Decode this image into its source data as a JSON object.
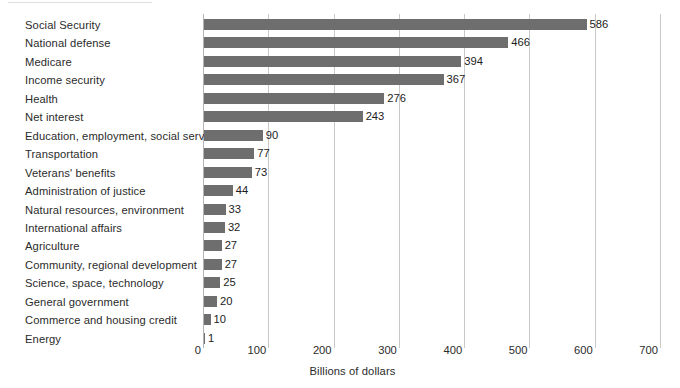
{
  "chart_data": {
    "type": "bar",
    "orientation": "horizontal",
    "title": "",
    "subtitle": "",
    "xlabel": "Billions of dollars",
    "ylabel": "",
    "xlim": [
      0,
      700
    ],
    "xticks": [
      0,
      100,
      200,
      300,
      400,
      500,
      600,
      700
    ],
    "xtick_labels": [
      "0",
      "100",
      "200",
      "300",
      "400",
      "500",
      "600",
      "700"
    ],
    "grid": true,
    "legend": false,
    "bar_color": "#6e6e6e",
    "gridline_color": "#c9c9c9",
    "value_labels_shown": true,
    "categories": [
      "Social Security",
      "National defense",
      "Medicare",
      "Income security",
      "Health",
      "Net interest",
      "Education, employment, social services",
      "Transportation",
      "Veterans' benefits",
      "Administration of justice",
      "Natural resources, environment",
      "International affairs",
      "Agriculture",
      "Community, regional development",
      "Science, space, technology",
      "General government",
      "Commerce and housing credit",
      "Energy"
    ],
    "values": [
      586,
      466,
      394,
      367,
      276,
      243,
      90,
      77,
      73,
      44,
      33,
      32,
      27,
      27,
      25,
      20,
      10,
      1
    ],
    "value_label_texts": [
      "586",
      "466",
      "394",
      "367",
      "276",
      "243",
      "90",
      "77",
      "73",
      "44",
      "33",
      "32",
      "27",
      "27",
      "25",
      "20",
      "10",
      "1"
    ]
  }
}
